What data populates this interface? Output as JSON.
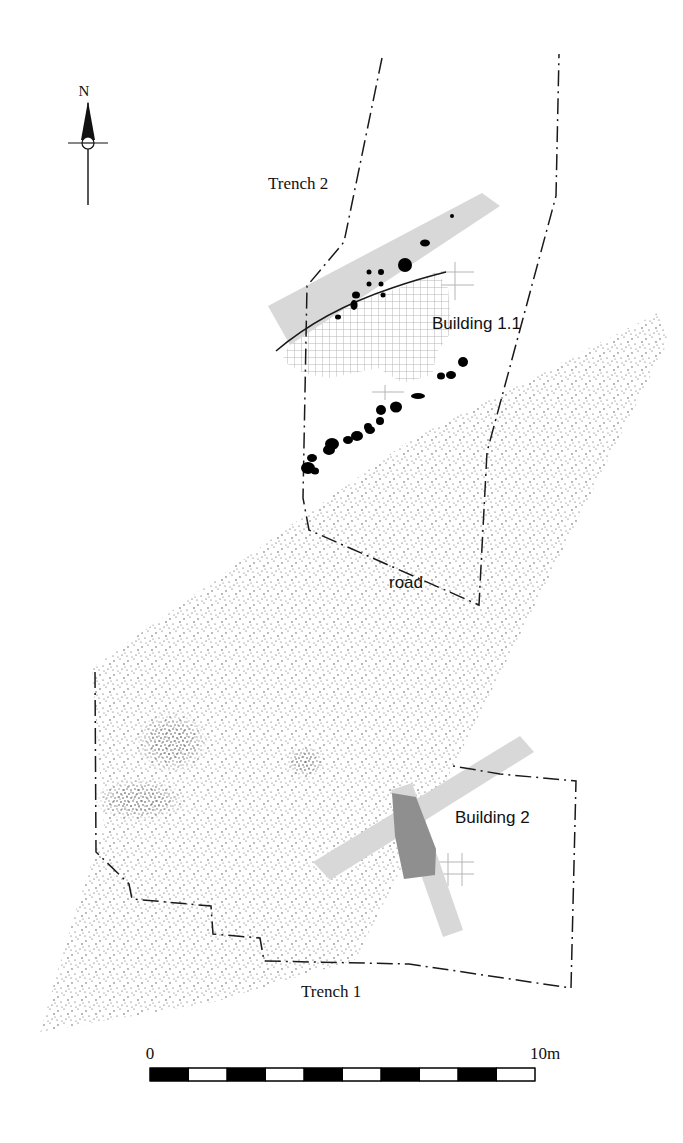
{
  "figure": {
    "type": "archaeological-site-plan",
    "background_color": "#ffffff",
    "width": 683,
    "height": 1143
  },
  "north_arrow": {
    "label": "N",
    "label_x": 84,
    "label_y": 96,
    "shaft_x": 88,
    "shaft_top": 100,
    "shaft_bottom": 205,
    "arrow_tip_y": 103,
    "arrow_base_y": 140,
    "arrow_half_width": 7,
    "circle_cx": 88,
    "circle_cy": 143,
    "circle_r": 6,
    "tick_x1": 68,
    "tick_x2": 108,
    "color": "#111111"
  },
  "labels": [
    {
      "name": "trench-2-label",
      "text": "Trench 2",
      "x": 268,
      "y": 189,
      "style": "serif"
    },
    {
      "name": "building-1-1-label",
      "text": "Building 1.1",
      "x": 432,
      "y": 329,
      "style": "sans"
    },
    {
      "name": "road-label",
      "text": "road",
      "x": 389,
      "y": 588,
      "style": "sans"
    },
    {
      "name": "building-2-label",
      "text": "Building 2",
      "x": 455,
      "y": 823,
      "style": "sans"
    },
    {
      "name": "trench-1-label",
      "text": "Trench 1",
      "x": 301,
      "y": 997,
      "style": "serif"
    }
  ],
  "scale_bar": {
    "start_label": "0",
    "end_label": "10m",
    "start_label_x": 150,
    "start_label_y": 1059,
    "end_label_x": 545,
    "end_label_y": 1059,
    "x": 150,
    "y": 1068,
    "width": 385,
    "height": 13,
    "segments": 10,
    "segment_values": [
      "0",
      "1",
      "2",
      "3",
      "4",
      "5",
      "6",
      "7",
      "8",
      "9",
      "10"
    ],
    "fill_dark": "#000000",
    "fill_light": "#ffffff",
    "stroke": "#000000"
  },
  "colors": {
    "line": "#1a1a1a",
    "band_grey": "#d8d8d8",
    "band_grey_dark": "#8f8f8f",
    "hatch_grey": "#b0b0b0",
    "stipple": "#4a4a4a",
    "posthole": "#000000"
  },
  "trenches": [
    {
      "name": "trench-2-outline",
      "label": "Trench 2",
      "style": "dash-dot",
      "points": "382,58 344,242 307,286 303,498 309,530 479,605 487,452 556,196 559,54"
    },
    {
      "name": "trench-1-outline",
      "label": "Trench 1",
      "style": "dash-dot",
      "points": "95,672 96,852 129,884 132,899 211,906 213,934 260,938 264,961 409,964 571,988 576,781 500,774 453,766"
    }
  ],
  "road": {
    "name": "road-stipple-area",
    "label": "road",
    "points": "40,1032 75,912 104,826 92,668 410,440 660,312 668,342 355,960 214,1002"
  },
  "grey_bands": [
    {
      "name": "trench-2-baulk-band",
      "points": "268,306 482,193 500,206 290,345"
    },
    {
      "name": "building-2-baulk-band",
      "points": "313,862 520,736 534,752 330,880"
    },
    {
      "name": "building-2-wall-band",
      "points": "391,790 412,783 463,930 443,937"
    }
  ],
  "dark_features": [
    {
      "name": "building-2-dark-wedge",
      "points": "392,793 416,797 436,849 435,875 404,879 395,836"
    }
  ],
  "hatched_areas": [
    {
      "name": "building-1-1-hatch",
      "points": "282,361 296,330 340,306 399,288 436,272 448,288 452,331 437,352 432,375 403,383 378,368 330,378 306,374"
    }
  ],
  "curved_walls": [
    {
      "name": "building-1-1-wall-line",
      "path": "M 276,351 C 310,322 350,302 392,288 C 412,281 430,276 446,272"
    }
  ],
  "postholes": [
    {
      "cx": 452,
      "cy": 216,
      "rx": 2,
      "ry": 2
    },
    {
      "cx": 425,
      "cy": 243,
      "rx": 5,
      "ry": 3.5
    },
    {
      "cx": 405,
      "cy": 265,
      "rx": 7,
      "ry": 7
    },
    {
      "cx": 381,
      "cy": 272,
      "rx": 3,
      "ry": 3
    },
    {
      "cx": 369,
      "cy": 272,
      "rx": 2.5,
      "ry": 2.5
    },
    {
      "cx": 381,
      "cy": 284,
      "rx": 2.5,
      "ry": 2.5
    },
    {
      "cx": 369,
      "cy": 284,
      "rx": 2.5,
      "ry": 2.5
    },
    {
      "cx": 356,
      "cy": 295,
      "rx": 4,
      "ry": 3.5
    },
    {
      "cx": 354,
      "cy": 305,
      "rx": 3.5,
      "ry": 5
    },
    {
      "cx": 338,
      "cy": 317,
      "rx": 3,
      "ry": 2.5
    },
    {
      "cx": 383,
      "cy": 295,
      "rx": 2.5,
      "ry": 2.5
    },
    {
      "cx": 463,
      "cy": 362,
      "rx": 5,
      "ry": 5
    },
    {
      "cx": 451,
      "cy": 375,
      "rx": 5,
      "ry": 4
    },
    {
      "cx": 441,
      "cy": 376,
      "rx": 4,
      "ry": 3.5
    },
    {
      "cx": 418,
      "cy": 396,
      "rx": 7,
      "ry": 3
    },
    {
      "cx": 396,
      "cy": 407,
      "rx": 6,
      "ry": 5.5
    },
    {
      "cx": 381,
      "cy": 410,
      "rx": 5,
      "ry": 5
    },
    {
      "cx": 380,
      "cy": 421,
      "rx": 4,
      "ry": 4
    },
    {
      "cx": 368,
      "cy": 427,
      "rx": 4,
      "ry": 4
    },
    {
      "cx": 370,
      "cy": 430,
      "rx": 5,
      "ry": 4
    },
    {
      "cx": 357,
      "cy": 436,
      "rx": 6,
      "ry": 5
    },
    {
      "cx": 348,
      "cy": 440,
      "rx": 5,
      "ry": 4
    },
    {
      "cx": 332,
      "cy": 444,
      "rx": 7,
      "ry": 6
    },
    {
      "cx": 329,
      "cy": 450,
      "rx": 6,
      "ry": 5
    },
    {
      "cx": 312,
      "cy": 458,
      "rx": 5,
      "ry": 4
    },
    {
      "cx": 308,
      "cy": 468,
      "rx": 7,
      "ry": 6
    },
    {
      "cx": 315,
      "cy": 471,
      "rx": 4,
      "ry": 3.5
    }
  ],
  "stipple_patches": [
    {
      "name": "dense-patch-north",
      "cx": 172,
      "cy": 742,
      "rx": 38,
      "ry": 32
    },
    {
      "name": "dense-patch-south",
      "cx": 140,
      "cy": 800,
      "rx": 48,
      "ry": 22
    },
    {
      "name": "dense-patch-east",
      "cx": 305,
      "cy": 762,
      "rx": 20,
      "ry": 17
    }
  ]
}
